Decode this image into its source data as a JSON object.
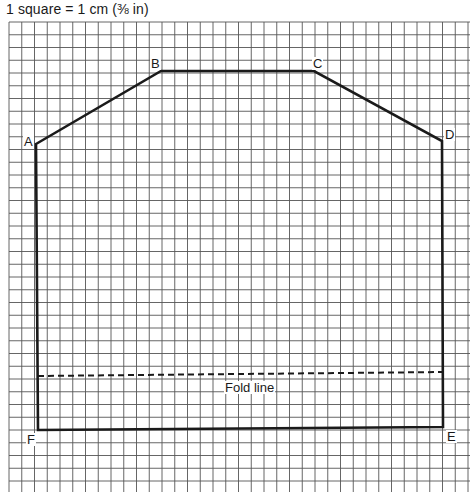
{
  "caption": "1 square = 1 cm (⅜ in)",
  "grid": {
    "left": 9,
    "top": 22,
    "right": 470,
    "bottom": 492,
    "spacing": 12.75,
    "line_color": "#555555"
  },
  "shape": {
    "stroke_color": "#1a1a1a",
    "points": {
      "A": [
        36,
        144
      ],
      "B": [
        161,
        71
      ],
      "C": [
        314,
        71
      ],
      "D": [
        442,
        141
      ],
      "E": [
        443,
        427
      ],
      "F": [
        38,
        430
      ]
    }
  },
  "labels": {
    "A": "A",
    "B": "B",
    "C": "C",
    "D": "D",
    "E": "E",
    "F": "F"
  },
  "fold_line": {
    "label": "Fold line",
    "start": [
      38,
      376
    ],
    "end": [
      443,
      372
    ]
  }
}
